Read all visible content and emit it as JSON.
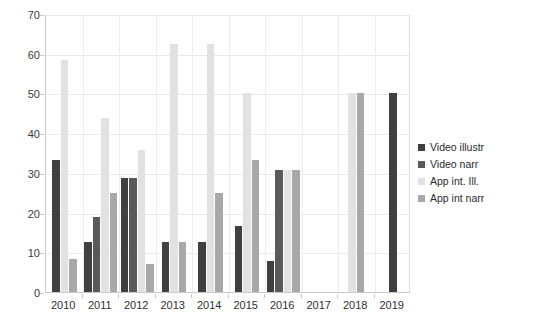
{
  "chart_data": {
    "type": "bar",
    "title": "",
    "subtitle": "",
    "xlabel": "",
    "ylabel": "",
    "categories": [
      "2010",
      "2011",
      "2012",
      "2013",
      "2014",
      "2015",
      "2016",
      "2017",
      "2018",
      "2019"
    ],
    "ylim": [
      0,
      70
    ],
    "ytick_values": [
      0,
      10,
      20,
      30,
      40,
      50,
      60,
      70
    ],
    "ytick_labels": [
      "0",
      "10",
      "20",
      "30",
      "40",
      "50",
      "60",
      "70"
    ],
    "grid": "horizontal-and-vertical",
    "legend_position": "right",
    "series": [
      {
        "name": "Video illustr",
        "color": "#404040",
        "values": [
          33.3,
          12.5,
          28.6,
          12.5,
          12.5,
          16.7,
          7.7,
          0,
          0,
          50
        ]
      },
      {
        "name": "Video narr",
        "color": "#595959",
        "values": [
          0,
          18.8,
          28.6,
          0,
          0,
          0,
          30.8,
          0,
          0,
          0
        ]
      },
      {
        "name": "App int. Ill.",
        "color": "#e2e2e2",
        "values": [
          58.3,
          43.8,
          35.7,
          62.5,
          62.5,
          50.0,
          30.8,
          0,
          50,
          0
        ]
      },
      {
        "name": "App int narr",
        "color": "#a8a8a8",
        "values": [
          8.3,
          25.0,
          7.1,
          12.5,
          25.0,
          33.3,
          30.8,
          0,
          50,
          0
        ]
      }
    ]
  },
  "legend": {
    "items": [
      {
        "label": "Video illustr",
        "color": "#404040"
      },
      {
        "label": "Video narr",
        "color": "#595959"
      },
      {
        "label": "App int. Ill.",
        "color": "#e2e2e2"
      },
      {
        "label": "App int narr",
        "color": "#a8a8a8"
      }
    ]
  },
  "caption": {
    "text": ""
  }
}
